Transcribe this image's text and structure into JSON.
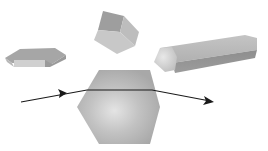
{
  "diagram": {
    "shapes": [
      {
        "id": "hexagonal-plate",
        "kind": "flat hexagonal plate"
      },
      {
        "id": "short-prism",
        "kind": "short hexagonal prism"
      },
      {
        "id": "hexagonal-column",
        "kind": "long hexagonal column"
      },
      {
        "id": "hexagon-cross-section",
        "kind": "large hexagon face"
      }
    ],
    "ray": {
      "description": "light ray entering and exiting hexagon, bent by refraction"
    },
    "colors": {
      "background": "#ffffff",
      "crystal_light": "#d6d6d6",
      "crystal_mid": "#aaaaaa",
      "crystal_dark": "#8a8a8a",
      "ray": "#1a1a1a"
    }
  }
}
